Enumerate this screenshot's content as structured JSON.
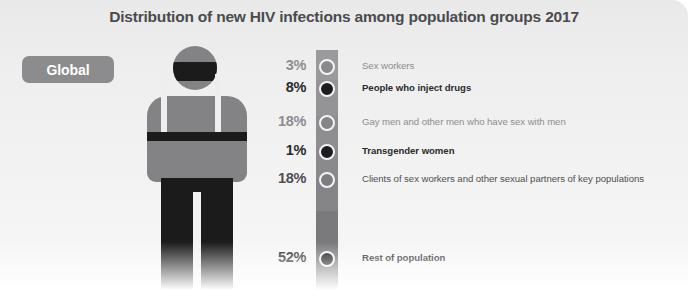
{
  "chart_data": {
    "type": "bar",
    "title": "Distribution of new HIV infections among population groups 2017",
    "xlabel": "",
    "ylabel": "",
    "region": "Global",
    "unit": "percent",
    "total": 100,
    "categories": [
      "Sex workers",
      "People who inject drugs",
      "Gay men and other men who have sex with men",
      "Transgender women",
      "Clients of sex workers and other sexual partners of key populations",
      "Rest of population"
    ],
    "values": [
      3,
      8,
      18,
      1,
      18,
      52
    ],
    "value_labels": [
      "3%",
      "8%",
      "18%",
      "1%",
      "18%",
      "52%"
    ],
    "legend": "",
    "grid": false
  },
  "header": {
    "title": "Distribution of new HIV infections among population groups 2017"
  },
  "badge": {
    "label": "Global"
  },
  "rows": [
    {
      "pct": "3%",
      "label": "Sex workers",
      "pct_color": "#8d8d8f",
      "label_color": "#8d8d8f",
      "bold": false,
      "dot_color": "#8a8a8c",
      "seg_color": "#9a9a9c",
      "top": 57,
      "seg_top": 0,
      "seg_height": 30,
      "dot_top": 59
    },
    {
      "pct": "8%",
      "label": "People who inject drugs",
      "pct_color": "#2a2a2c",
      "label_color": "#2a2a2c",
      "bold": true,
      "dot_color": "#1d1d1f",
      "seg_color": "#949496",
      "top": 79,
      "seg_top": 30,
      "seg_height": 36,
      "dot_top": 81
    },
    {
      "pct": "18%",
      "label": "Gay men and other men who have sex with men",
      "pct_color": "#8d8d8f",
      "label_color": "#8d8d8f",
      "bold": false,
      "dot_color": "#858587",
      "seg_color": "#8e8e90",
      "top": 113,
      "seg_top": 66,
      "seg_height": 33,
      "dot_top": 115
    },
    {
      "pct": "1%",
      "label": "Transgender women",
      "pct_color": "#2a2a2c",
      "label_color": "#2a2a2c",
      "bold": true,
      "dot_color": "#1d1d1f",
      "seg_color": "#8a8a8c",
      "top": 142,
      "seg_top": 99,
      "seg_height": 30,
      "dot_top": 144
    },
    {
      "pct": "18%",
      "label": "Clients of sex workers and other sexual partners of key populations",
      "pct_color": "#4f4f51",
      "label_color": "#4f4f51",
      "bold": false,
      "dot_color": "#7d7d7f",
      "seg_color": "#858587",
      "top": 170,
      "seg_top": 129,
      "seg_height": 32,
      "dot_top": 172
    },
    {
      "pct": "52%",
      "label": "Rest of population",
      "pct_color": "#2a2a2c",
      "label_color": "#2a2a2c",
      "bold": true,
      "dot_color": "#1d1d1f",
      "seg_color": "#7a7a7c",
      "top": 249,
      "seg_top": 161,
      "seg_height": 81,
      "dot_top": 251
    }
  ]
}
